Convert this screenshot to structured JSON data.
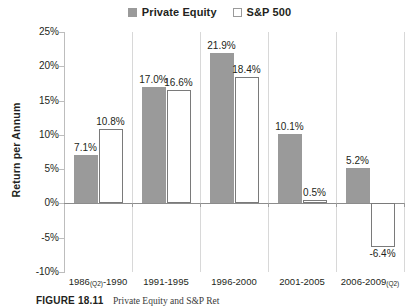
{
  "legend": {
    "position": "top-center",
    "entries": [
      {
        "label": "Private Equity",
        "swatch": "filled-gray-square-icon",
        "color": "#9a9a9a"
      },
      {
        "label": "S&P 500",
        "swatch": "outlined-white-square-icon",
        "color": "#ffffff"
      }
    ]
  },
  "axes": {
    "ylabel": "Return per Annum",
    "yticks": [
      "25%",
      "20%",
      "15%",
      "10%",
      "5%",
      "0%",
      "-5%",
      "-10%"
    ]
  },
  "caption": {
    "number": "FIGURE 18.11",
    "text": "Private Equity and S&P Ret"
  },
  "chart_data": {
    "type": "bar",
    "title": "",
    "subtitle": "",
    "xlabel": "",
    "ylabel": "Return per Annum",
    "ylim": [
      -10,
      25
    ],
    "ytick_values": [
      25,
      20,
      15,
      10,
      5,
      0,
      -5,
      -10
    ],
    "ytick_labels": [
      "25%",
      "20%",
      "15%",
      "10%",
      "5%",
      "0%",
      "-5%",
      "-10%"
    ],
    "grid": false,
    "legend_position": "top-center",
    "categories": [
      "1986(Q2)-1990",
      "1991-1995",
      "1996-2000",
      "2001-2005",
      "2006-2009(Q2)"
    ],
    "category_parts": [
      {
        "main": "1986",
        "sub": "(Q2)",
        "tail": "-1990"
      },
      {
        "main": "1991-1995",
        "sub": "",
        "tail": ""
      },
      {
        "main": "1996-2000",
        "sub": "",
        "tail": ""
      },
      {
        "main": "2001-2005",
        "sub": "",
        "tail": ""
      },
      {
        "main": "2006-2009",
        "sub": "(Q2)",
        "tail": ""
      }
    ],
    "series": [
      {
        "name": "Private Equity",
        "color": "#9a9a9a",
        "values": [
          7.1,
          17.0,
          21.9,
          10.1,
          5.2
        ],
        "labels": [
          "7.1%",
          "17.0%",
          "21.9%",
          "10.1%",
          "5.2%"
        ]
      },
      {
        "name": "S&P 500",
        "color": "#ffffff",
        "values": [
          10.8,
          16.6,
          18.4,
          0.5,
          -6.4
        ],
        "labels": [
          "10.8%",
          "16.6%",
          "18.4%",
          "0.5%",
          "-6.4%"
        ]
      }
    ]
  }
}
